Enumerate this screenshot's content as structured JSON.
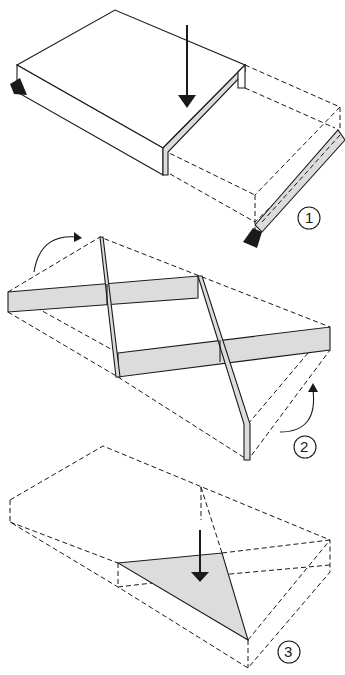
{
  "diagram": {
    "type": "folding-instructions",
    "steps": [
      {
        "number": "1",
        "label_text": "1",
        "description": "Fold slab along line; arrow pushes down, flap folds back"
      },
      {
        "number": "2",
        "label_text": "2",
        "description": "Crossed shaded strips with rotation arrows at corners"
      },
      {
        "number": "3",
        "label_text": "3",
        "description": "Shaded triangle folded down inside dashed box"
      }
    ],
    "colors": {
      "line": "#1a1a1a",
      "shade": "#dcdcdc",
      "background": "#ffffff"
    }
  }
}
